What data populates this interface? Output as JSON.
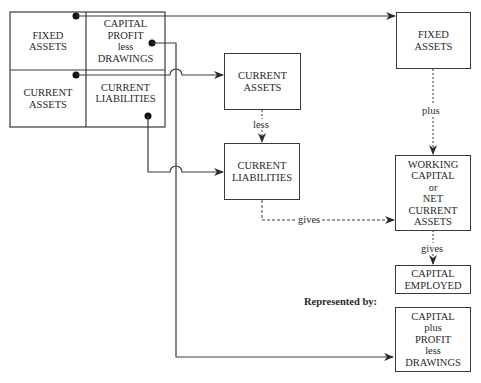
{
  "grid": {
    "fixed_assets": "FIXED\nASSETS",
    "capital_profit_drawings": "CAPITAL\nPROFIT\nless\nDRAWINGS",
    "current_assets": "CURRENT\nASSETS",
    "current_liabilities": "CURRENT\nLIABILITIES"
  },
  "boxes": {
    "fixed_assets": "FIXED\nASSETS",
    "current_assets": "CURRENT\nASSETS",
    "current_liabilities": "CURRENT\nLIABILITIES",
    "working_capital": "WORKING\nCAPITAL\nor\nNET\nCURRENT\nASSETS",
    "capital_employed": "CAPITAL\nEMPLOYED",
    "capital_plus_profit": "CAPITAL\nplus\nPROFIT\nless\nDRAWINGS"
  },
  "labels": {
    "less": "less",
    "plus": "plus",
    "gives_horizontal": "gives",
    "gives_vertical": "gives",
    "represented_by": "Represented by:"
  },
  "colors": {
    "line": "#3a3a3a",
    "background": "#ffffff"
  }
}
